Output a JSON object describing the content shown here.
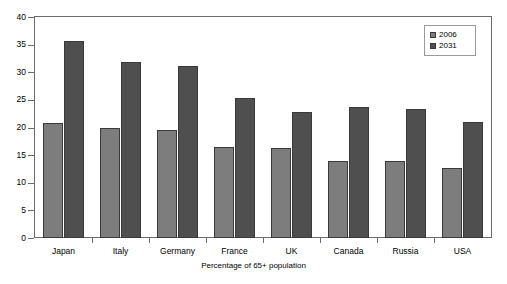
{
  "chart_data": {
    "type": "bar",
    "title": "",
    "subtitle": "",
    "xlabel": "Percentage of 65+ population",
    "ylabel": "",
    "ylim": [
      0,
      40
    ],
    "yticks": [
      0,
      5,
      10,
      15,
      20,
      25,
      30,
      35,
      40
    ],
    "grid": false,
    "legend_position": "top-right-inside",
    "categories": [
      "Japan",
      "Italy",
      "Germany",
      "France",
      "UK",
      "Canada",
      "Russia",
      "USA"
    ],
    "series": [
      {
        "name": "2006",
        "color": "#7d7d7d",
        "values": [
          20.9,
          19.9,
          19.5,
          16.4,
          16.3,
          13.9,
          14.0,
          12.6
        ]
      },
      {
        "name": "2031",
        "color": "#4f4f4f",
        "values": [
          35.6,
          31.9,
          31.2,
          25.3,
          22.8,
          23.8,
          23.4,
          21.0
        ]
      }
    ]
  },
  "legend": {
    "entries": [
      {
        "label": "2006",
        "swatch": "legend-swatch-2006"
      },
      {
        "label": "2031",
        "swatch": "legend-swatch-2031"
      }
    ]
  },
  "axes": {
    "y_tick_labels": [
      "40",
      "35",
      "30",
      "25",
      "20",
      "15",
      "10",
      "5",
      "0"
    ],
    "x_tick_labels": [
      "Japan",
      "Italy",
      "Germany",
      "France",
      "UK",
      "Canada",
      "Russia",
      "USA"
    ],
    "x_axis_title": "Percentage of 65+ population"
  }
}
